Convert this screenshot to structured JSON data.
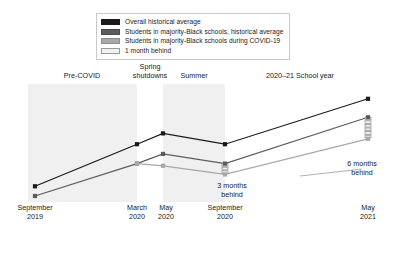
{
  "legend": {
    "items": [
      {
        "label": "Overall historical average",
        "color": "#1a1a1a",
        "border": "#1a1a1a"
      },
      {
        "label": "Students in majority-Black schools, historical average",
        "color": "#5c5c5c",
        "border": "#4a4a4a"
      },
      {
        "label": "Students in majority-Black schools during COVID-19",
        "color": "#a8a8a8",
        "border": "#8c8c8c"
      },
      {
        "label": "1 month behind",
        "color": "#f2f2f2",
        "border": "#9a9a9a"
      }
    ]
  },
  "periods": [
    {
      "label": "Pre-COVID"
    },
    {
      "label": "Spring\nshutdowns"
    },
    {
      "label": "Summer"
    },
    {
      "label": "2020–21 School year"
    }
  ],
  "annotations": [
    {
      "label": "3 months\nbehind",
      "months": 3
    },
    {
      "label": "6 months\nbehind",
      "months": 6
    }
  ],
  "chart_data": {
    "type": "line",
    "title": "",
    "xlabel": "",
    "ylabel": "",
    "grid": false,
    "legend_position": "top",
    "categories": [
      "September\n2019",
      "March\n2020",
      "May\n2020",
      "September\n2020",
      "May\n2021"
    ],
    "x": [
      "September 2019",
      "March 2020",
      "May 2020",
      "September 2020",
      "May 2021"
    ],
    "bands": [
      {
        "name": "Pre-COVID",
        "from": "September 2019",
        "to": "March 2020",
        "shaded": true
      },
      {
        "name": "Spring shutdowns",
        "from": "March 2020",
        "to": "May 2020",
        "shaded": false
      },
      {
        "name": "Summer",
        "from": "May 2020",
        "to": "September 2020",
        "shaded": true
      },
      {
        "name": "2020–21 School year",
        "from": "September 2020",
        "to": "May 2021",
        "shaded": false
      }
    ],
    "series": [
      {
        "name": "Overall historical average",
        "color": "#1a1a1a",
        "values": [
          9,
          48,
          58,
          48,
          90
        ]
      },
      {
        "name": "Students in majority-Black schools, historical average",
        "color": "#5c5c5c",
        "values": [
          0,
          30,
          39,
          30,
          73
        ]
      },
      {
        "name": "Students in majority-Black schools during COVID-19",
        "color": "#a8a8a8",
        "values": [
          null,
          30,
          28,
          20,
          53
        ]
      }
    ],
    "ylim": [
      0,
      100
    ],
    "yunit": "relative learning level (unlabeled axis)"
  }
}
